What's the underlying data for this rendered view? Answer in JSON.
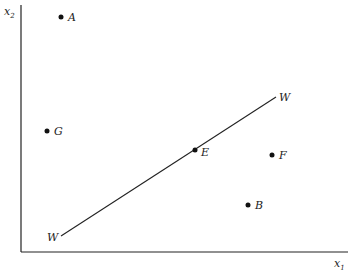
{
  "diagram": {
    "axes": {
      "x_label": "x",
      "x_subscript": "1",
      "y_label": "x",
      "y_subscript": "2"
    },
    "line": {
      "label_start": "W",
      "label_end": "W"
    },
    "points": [
      {
        "id": "A",
        "label": "A"
      },
      {
        "id": "G",
        "label": "G"
      },
      {
        "id": "E",
        "label": "E"
      },
      {
        "id": "F",
        "label": "F"
      },
      {
        "id": "B",
        "label": "B"
      }
    ]
  }
}
